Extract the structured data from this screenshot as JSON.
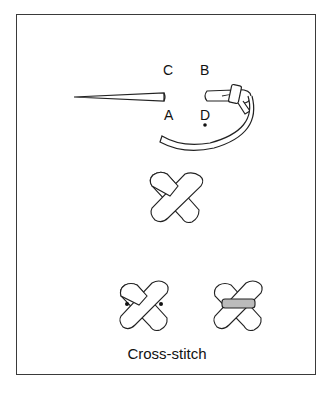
{
  "figure": {
    "labels": {
      "c": "C",
      "b": "B",
      "a": "A",
      "d": "D"
    },
    "caption": "Cross-stitch"
  }
}
